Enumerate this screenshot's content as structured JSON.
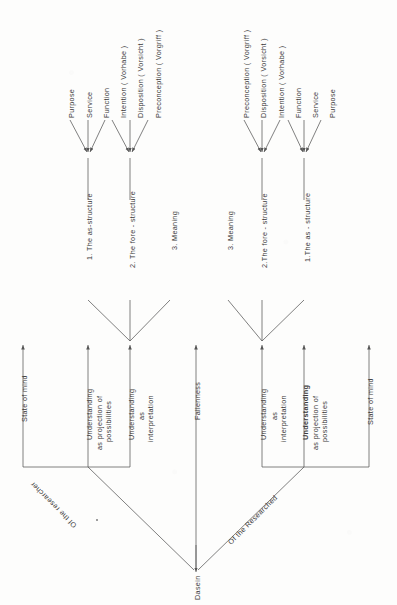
{
  "diagram": {
    "root_label": "Dasein",
    "stroke_color": "#555555",
    "text_color": "#3a3a3a",
    "background": "#fdfdfc",
    "branches": {
      "left_label": "Of the researcher",
      "center_label": "Fallenness",
      "right_label": "Of the Researched"
    },
    "left_side": {
      "state_of_mind": "State  of  mind",
      "understanding_projection_line1": "Understanding",
      "understanding_projection_line2": "as projection of",
      "understanding_projection_line3": "possibilities",
      "understanding_interpretation_line1": "Understanding",
      "understanding_interpretation_line2": "as",
      "understanding_interpretation_line3": "interpretation",
      "as_structure": "1. The  as-structure",
      "fore_structure": "2. The  fore - structure",
      "meaning": "3. Meaning",
      "as_structure_items": [
        "Purpose",
        "Service",
        "Function"
      ],
      "fore_structure_items": [
        "Intention  ( Vorhabe )",
        "Disposition ( Vorsicht )",
        "Preconception ( Vorgriff )"
      ]
    },
    "right_side": {
      "state_of_mind": "State of  mind",
      "understanding_projection_line1": "Understanding",
      "understanding_projection_line2": "as projection of",
      "understanding_projection_line3": "possibilities",
      "understanding_interpretation_line1": "Understanding",
      "understanding_interpretation_line2": "as",
      "understanding_interpretation_line3": "interpretation",
      "as_structure": "1.The  as - structure",
      "fore_structure": "2.The  fore - structure",
      "meaning": "3. Meaning",
      "fore_structure_items": [
        "Preconception  ( Vorgriff )",
        "Disposition ( Vorsicht )",
        "Intention  ( Vorhabe )"
      ],
      "as_structure_items": [
        "Function",
        "Service",
        "Purpose"
      ]
    }
  }
}
